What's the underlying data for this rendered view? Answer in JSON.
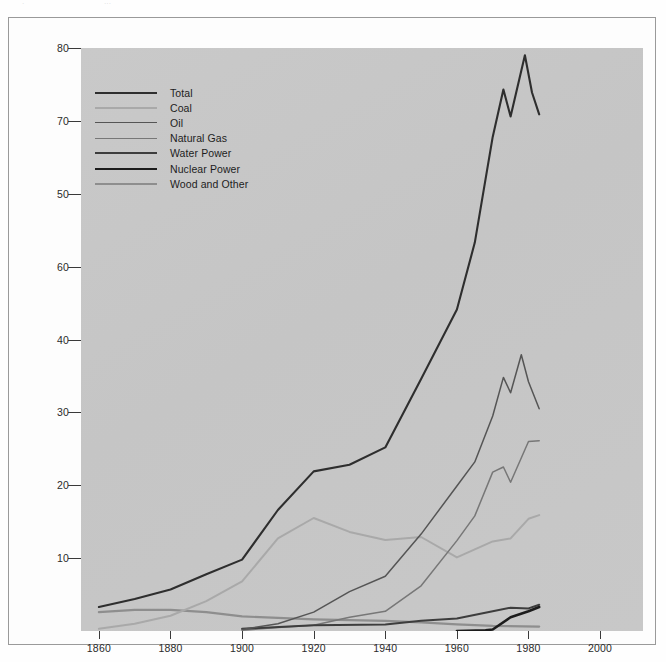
{
  "scan_artifacts": [
    "·",
    "···"
  ],
  "axes": {
    "y_title": "Energy Consumption (quadrillion BTU's)",
    "y_tick_labels": [
      "80",
      "70",
      "50",
      "60",
      "40",
      "30",
      "20",
      "10"
    ],
    "y_tick_values": [
      80,
      70,
      60,
      50,
      40,
      30,
      20,
      10
    ],
    "x_tick_labels": [
      "1860",
      "1880",
      "1900",
      "1920",
      "1940",
      "1960",
      "1980",
      "2000"
    ],
    "x_tick_values": [
      1860,
      1880,
      1900,
      1920,
      1940,
      1960,
      1980,
      2000
    ]
  },
  "legend": {
    "items": [
      {
        "label": "Total",
        "color": "#2e2e2e",
        "width": 2.1
      },
      {
        "label": "Coal",
        "color": "#a9a9a9",
        "width": 2.0
      },
      {
        "label": "Oil",
        "color": "#555555",
        "width": 1.5
      },
      {
        "label": "Natural Gas",
        "color": "#777777",
        "width": 1.5
      },
      {
        "label": "Water Power",
        "color": "#3d3d3d",
        "width": 2.0
      },
      {
        "label": "Nuclear Power",
        "color": "#1c1c1c",
        "width": 2.6
      },
      {
        "label": "Wood and Other",
        "color": "#8e8e8e",
        "width": 2.2
      }
    ]
  },
  "chart_data": {
    "type": "line",
    "title": "",
    "xlabel": "",
    "ylabel": "Energy Consumption (quadrillion BTU's)",
    "xlim": [
      1855,
      2012
    ],
    "ylim": [
      0,
      80
    ],
    "grid": false,
    "legend_position": "top-left inside plot",
    "note": "Printed y-axis tick labels appear in the order 80, 70, 50, 60, 40, 30, 20, 10 - the 50 and 60 labels are transposed in the source scan; data are plotted on the true linear scale.",
    "series": [
      {
        "name": "Total",
        "color": "#2e2e2e",
        "x": [
          1860,
          1870,
          1880,
          1890,
          1900,
          1910,
          1920,
          1930,
          1940,
          1950,
          1960,
          1965,
          1970,
          1973,
          1975,
          1979,
          1981,
          1983
        ],
        "values": [
          3.3,
          4.4,
          5.7,
          7.8,
          9.8,
          16.6,
          21.9,
          22.8,
          25.2,
          34.6,
          44.1,
          53.3,
          67.8,
          74.3,
          70.6,
          79.0,
          73.9,
          70.9
        ]
      },
      {
        "name": "Coal",
        "color": "#a9a9a9",
        "x": [
          1860,
          1870,
          1880,
          1890,
          1900,
          1910,
          1920,
          1930,
          1940,
          1950,
          1960,
          1970,
          1975,
          1980,
          1983
        ],
        "values": [
          0.3,
          1.0,
          2.1,
          4.1,
          6.8,
          12.7,
          15.5,
          13.6,
          12.5,
          12.9,
          10.1,
          12.3,
          12.7,
          15.4,
          15.9
        ]
      },
      {
        "name": "Oil",
        "color": "#555555",
        "x": [
          1900,
          1910,
          1920,
          1930,
          1940,
          1950,
          1960,
          1965,
          1970,
          1973,
          1975,
          1978,
          1980,
          1983
        ],
        "values": [
          0.2,
          1.0,
          2.6,
          5.4,
          7.5,
          13.3,
          19.9,
          23.2,
          29.5,
          34.8,
          32.7,
          37.9,
          34.2,
          30.5
        ]
      },
      {
        "name": "Natural Gas",
        "color": "#777777",
        "x": [
          1900,
          1910,
          1920,
          1930,
          1940,
          1950,
          1960,
          1965,
          1970,
          1973,
          1975,
          1980,
          1983
        ],
        "values": [
          0.1,
          0.5,
          0.8,
          1.9,
          2.7,
          6.2,
          12.4,
          15.8,
          21.8,
          22.5,
          20.4,
          26.0,
          26.1
        ]
      },
      {
        "name": "Water Power",
        "color": "#3d3d3d",
        "x": [
          1900,
          1920,
          1940,
          1950,
          1960,
          1970,
          1975,
          1980,
          1983
        ],
        "values": [
          0.3,
          0.8,
          0.9,
          1.4,
          1.7,
          2.7,
          3.2,
          3.1,
          3.6
        ]
      },
      {
        "name": "Nuclear Power",
        "color": "#1c1c1c",
        "x": [
          1960,
          1968,
          1970,
          1975,
          1980,
          1983
        ],
        "values": [
          0.0,
          0.1,
          0.2,
          1.9,
          2.7,
          3.3
        ]
      },
      {
        "name": "Wood and Other",
        "color": "#8e8e8e",
        "x": [
          1860,
          1870,
          1880,
          1890,
          1900,
          1910,
          1920,
          1930,
          1940,
          1950,
          1960,
          1970,
          1983
        ],
        "values": [
          2.6,
          2.9,
          2.9,
          2.6,
          2.0,
          1.8,
          1.6,
          1.5,
          1.4,
          1.2,
          0.9,
          0.7,
          0.6
        ]
      }
    ]
  }
}
